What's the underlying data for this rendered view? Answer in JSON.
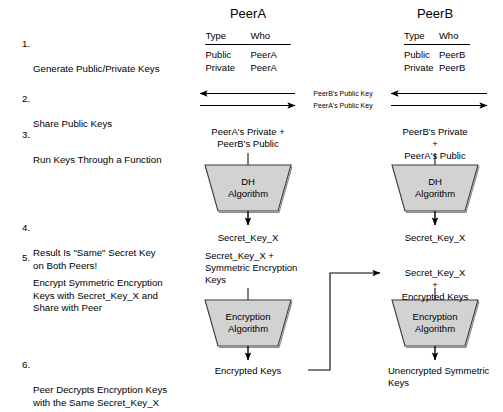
{
  "diagram": {
    "peers": {
      "left": {
        "name": "PeerA"
      },
      "right": {
        "name": "PeerB"
      }
    },
    "colors": {
      "trapezoid_fill": "#d2d2d2",
      "trapezoid_stroke": "#3a3a3a",
      "line": "#000000",
      "text": "#000000"
    }
  },
  "steps": [
    {
      "num": "1.",
      "text": "Generate Public/Private Keys"
    },
    {
      "num": "2.",
      "text": "Share Public Keys"
    },
    {
      "num": "3.",
      "text": "Run Keys Through a Function"
    },
    {
      "num": "4.",
      "text": "Result Is \"Same\" Secret Key\non Both Peers!"
    },
    {
      "num": "5.",
      "text": "Encrypt Symmetric Encryption\nKeys with Secret_Key_X and\nShare with Peer"
    },
    {
      "num": "6.",
      "text": "Peer Decrypts Encryption Keys\nwith the Same Secret_Key_X"
    }
  ],
  "key_tables": {
    "headers": {
      "type": "Type",
      "who": "Who"
    },
    "left": {
      "rows": [
        {
          "type": "Public",
          "who": "PeerA"
        },
        {
          "type": "Private",
          "who": "PeerA"
        }
      ]
    },
    "right": {
      "rows": [
        {
          "type": "Public",
          "who": "PeerB"
        },
        {
          "type": "Private",
          "who": "PeerB"
        }
      ]
    }
  },
  "exchange_arrows": [
    {
      "label": "PeerB's Public Key",
      "direction": "left"
    },
    {
      "label": "PeerA's Public Key",
      "direction": "right"
    }
  ],
  "left_column": {
    "dh_inputs": "PeerA's Private +\nPeerB's Public",
    "dh_box": "DH\nAlgorithm",
    "dh_output": "Secret_Key_X",
    "enc_inputs": "Secret_Key_X +\nSymmetric Encryption\nKeys",
    "enc_box": "Encryption\nAlgorithm",
    "enc_output": "Encrypted Keys"
  },
  "right_column": {
    "dh_inputs": "PeerB's Private +\nPeerA's Public",
    "dh_box": "DH\nAlgorithm",
    "dh_output": "Secret_Key_X",
    "enc_inputs": "Secret_Key_X +\nEncrypted Keys",
    "enc_box": "Encryption\nAlgorithm",
    "enc_output": "Unencrypted Symmetric\nKeys"
  }
}
